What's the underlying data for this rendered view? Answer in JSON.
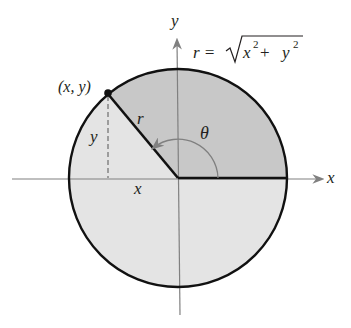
{
  "diagram": {
    "axes": {
      "x_label": "x",
      "y_label": "y"
    },
    "point_label": "(x, y)",
    "radius_label": "r",
    "angle_label": "θ",
    "horizontal_leg_label": "x",
    "vertical_leg_label": "y",
    "formula": {
      "lhs": "r = ",
      "radicand_x": "x",
      "exp_x": "2",
      "plus": " + ",
      "radicand_y": "y",
      "exp_y": "2"
    },
    "colors": {
      "shaded_sector": "#c8c8c8",
      "light_fill": "#e4e4e4",
      "outline": "#111111",
      "axis": "#808080",
      "text": "#231f20"
    }
  }
}
